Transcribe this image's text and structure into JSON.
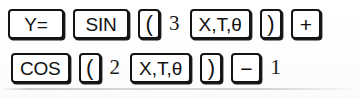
{
  "figure": {
    "kind": "calculator-keystroke-sequence",
    "expression_entered": "Y = sin(3X) + cos(2X) - 1",
    "ink_color": "#141414",
    "paper_color": "#fdfdfd"
  },
  "rows": [
    {
      "id": "row-1",
      "tokens": [
        {
          "label": "Y=",
          "type": "key",
          "style": "wide",
          "name": "key-y-equals"
        },
        {
          "label": "SIN",
          "type": "key",
          "style": "wide",
          "name": "key-sin"
        },
        {
          "label": "(",
          "type": "key",
          "style": "paren",
          "name": "key-open-paren"
        },
        {
          "label": "3",
          "type": "num",
          "style": "",
          "name": "digit-3"
        },
        {
          "label": "X,T,θ",
          "type": "key",
          "style": "var",
          "name": "key-x-t-theta"
        },
        {
          "label": ")",
          "type": "key",
          "style": "paren",
          "name": "key-close-paren"
        },
        {
          "label": "+",
          "type": "key",
          "style": "op",
          "name": "key-plus"
        }
      ]
    },
    {
      "id": "row-2",
      "tokens": [
        {
          "label": "COS",
          "type": "key",
          "style": "wide",
          "name": "key-cos"
        },
        {
          "label": "(",
          "type": "key",
          "style": "paren",
          "name": "key-open-paren"
        },
        {
          "label": "2",
          "type": "num",
          "style": "",
          "name": "digit-2"
        },
        {
          "label": "X,T,θ",
          "type": "key",
          "style": "var",
          "name": "key-x-t-theta"
        },
        {
          "label": ")",
          "type": "key",
          "style": "paren",
          "name": "key-close-paren"
        },
        {
          "label": "−",
          "type": "key",
          "style": "op",
          "name": "key-minus"
        },
        {
          "label": "1",
          "type": "num",
          "style": "last",
          "name": "digit-1"
        }
      ]
    }
  ]
}
